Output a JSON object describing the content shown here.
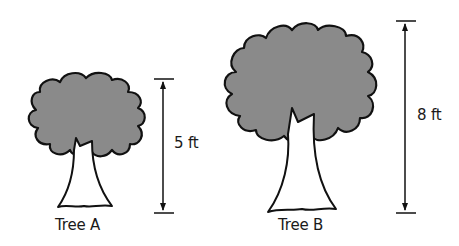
{
  "diagram": {
    "foliage_color": "#8a8a8a",
    "line_color": "#111111",
    "trees": [
      {
        "name": "Tree A",
        "height_label": "5 ft",
        "height_ft": 5
      },
      {
        "name": "Tree B",
        "height_label": "8 ft",
        "height_ft": 8
      }
    ]
  }
}
